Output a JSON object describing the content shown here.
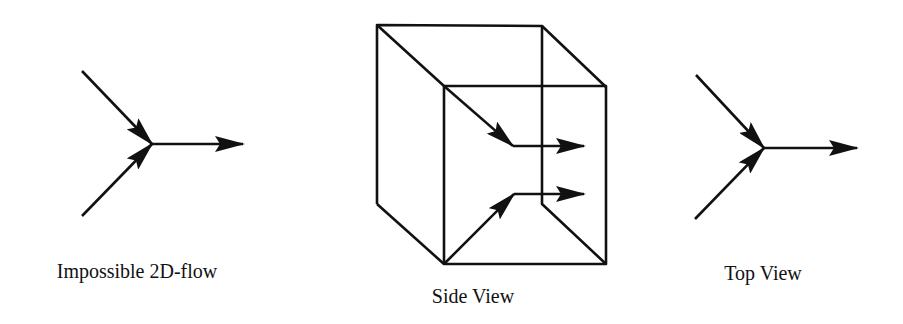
{
  "figure": {
    "panels": [
      {
        "id": "left",
        "label": "Impossible 2D-flow"
      },
      {
        "id": "middle",
        "label": "Side View"
      },
      {
        "id": "right",
        "label": "Top View"
      }
    ]
  },
  "colors": {
    "stroke": "#111111",
    "background": "#ffffff"
  }
}
